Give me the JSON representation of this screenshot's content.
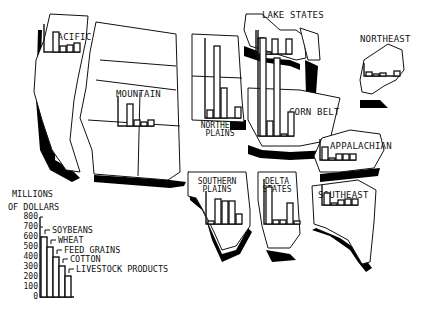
{
  "chart_data": {
    "type": "bar",
    "ylabel": "MILLIONS OF DOLLARS",
    "ylim": [
      0,
      800
    ],
    "yticks": [
      "800",
      "700",
      "600",
      "500",
      "400",
      "300",
      "200",
      "100",
      "0"
    ],
    "categories": [
      "SOYBEANS",
      "WHEAT",
      "FEED GRAINS",
      "COTTON",
      "LIVESTOCK PRODUCTS"
    ],
    "legend": {
      "title_line1": "MILLIONS",
      "title_line2": "OF DOLLARS",
      "sample_values": [
        600,
        500,
        400,
        310,
        210
      ]
    },
    "regions": [
      {
        "name": "PACIFIC",
        "values": [
          0,
          200,
          60,
          70,
          90
        ]
      },
      {
        "name": "MOUNTAIN",
        "values": [
          0,
          220,
          60,
          40,
          60
        ]
      },
      {
        "name": "NORTHERN PLAINS",
        "values": [
          80,
          720,
          300,
          0,
          110
        ]
      },
      {
        "name": "LAKE STATES",
        "values": [
          160,
          20,
          150,
          0,
          150
        ]
      },
      {
        "name": "CORN BELT",
        "values": [
          980,
          150,
          780,
          20,
          240
        ]
      },
      {
        "name": "NORTHEAST",
        "values": [
          40,
          20,
          30,
          0,
          50
        ]
      },
      {
        "name": "APPALACHIAN",
        "values": [
          130,
          20,
          60,
          60,
          60
        ]
      },
      {
        "name": "SOUTHERN PLAINS",
        "values": [
          30,
          250,
          230,
          230,
          100
        ]
      },
      {
        "name": "DELTA STATES",
        "values": [
          370,
          40,
          40,
          210,
          30
        ]
      },
      {
        "name": "SOUTHEAST",
        "values": [
          120,
          20,
          50,
          60,
          60
        ]
      }
    ]
  }
}
